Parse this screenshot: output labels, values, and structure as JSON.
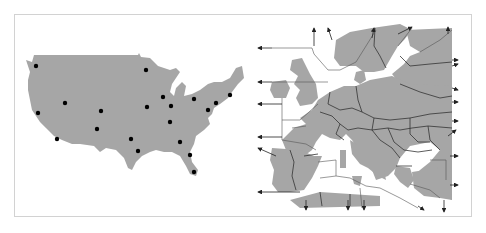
{
  "figure": {
    "panels": [
      {
        "id": "usa",
        "label": "United States map with city points",
        "land_color": "#a6a6a6",
        "point_color": "#000000",
        "points": [
          {
            "x": 36,
            "y": 66
          },
          {
            "x": 146,
            "y": 70
          },
          {
            "x": 65,
            "y": 103
          },
          {
            "x": 38,
            "y": 113
          },
          {
            "x": 101,
            "y": 111
          },
          {
            "x": 147,
            "y": 107
          },
          {
            "x": 163,
            "y": 97
          },
          {
            "x": 171,
            "y": 106
          },
          {
            "x": 194,
            "y": 99
          },
          {
            "x": 230,
            "y": 95
          },
          {
            "x": 216,
            "y": 103
          },
          {
            "x": 208,
            "y": 110
          },
          {
            "x": 97,
            "y": 129
          },
          {
            "x": 57,
            "y": 139
          },
          {
            "x": 170,
            "y": 122
          },
          {
            "x": 131,
            "y": 139
          },
          {
            "x": 138,
            "y": 151
          },
          {
            "x": 180,
            "y": 142
          },
          {
            "x": 190,
            "y": 155
          },
          {
            "x": 194,
            "y": 172
          }
        ]
      },
      {
        "id": "europe",
        "label": "Europe map with Voronoi-style regions and outward arrows",
        "land_color": "#a6a6a6",
        "border_color": "#333333",
        "arrow_color": "#222222"
      }
    ],
    "frame_color": "#d2d2d2"
  }
}
